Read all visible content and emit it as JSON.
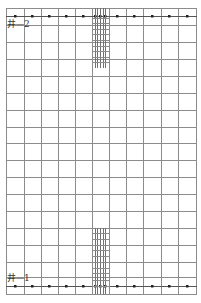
{
  "diagram": {
    "type": "well-grid-layout",
    "labels": {
      "top_well": "井—2",
      "bottom_well": "井—1"
    },
    "colors": {
      "background": "#ffffff",
      "grid_line": "#8c8c8c",
      "ladder_line": "#707070",
      "dot": "#222222",
      "label": "#333333"
    },
    "grid": {
      "x_lines": [
        6,
        24,
        41,
        58,
        75,
        92,
        109,
        126,
        143,
        161,
        178,
        196
      ],
      "y_lines": [
        8,
        25,
        42,
        59,
        76,
        93,
        110,
        127,
        143,
        160,
        177,
        194,
        211,
        228,
        245,
        262,
        277,
        294
      ],
      "left": 6,
      "right": 196,
      "top": 8,
      "bottom": 294
    },
    "dot_rows": [
      {
        "y": 16,
        "xs": [
          15,
          32,
          49,
          66,
          83,
          95,
          100,
          105,
          117,
          134,
          152,
          169,
          187
        ]
      },
      {
        "y": 286,
        "xs": [
          15,
          32,
          49,
          66,
          83,
          95,
          100,
          105,
          117,
          134,
          152,
          169,
          187
        ]
      }
    ],
    "ladder": {
      "x_lines": [
        95,
        97,
        100,
        103,
        105
      ],
      "segments": [
        {
          "y_start": 8,
          "y_end": 68,
          "rungs": [
            18,
            23,
            29,
            34,
            40,
            46,
            51,
            57,
            62
          ]
        },
        {
          "y_start": 228,
          "y_end": 294,
          "rungs": [
            233,
            239,
            245,
            250,
            256,
            262,
            268,
            273,
            280,
            286
          ]
        }
      ]
    }
  }
}
